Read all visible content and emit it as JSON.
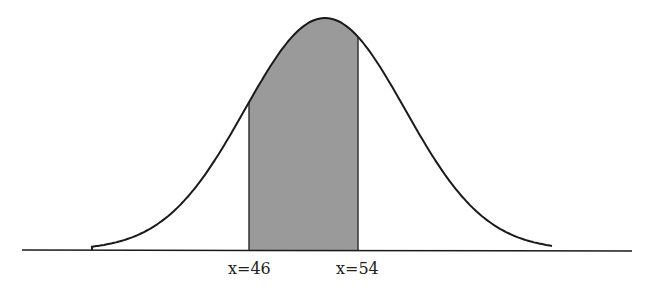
{
  "diagram": {
    "type": "normal-distribution-shaded-area",
    "curve": {
      "peak_px": [
        325,
        18
      ],
      "sigma_px": 80,
      "baseline_y_px": 250,
      "x_start_px": 22,
      "x_end_px": 632,
      "stroke_color": "#1a1a1a"
    },
    "shaded_region": {
      "left_px": 249,
      "right_px": 358,
      "fill_color": "#9a9a9a",
      "edge_color": "#333333"
    },
    "labels": [
      {
        "text": "x=46",
        "x_px": 228,
        "y_px": 259
      },
      {
        "text": "x=54",
        "x_px": 336,
        "y_px": 259
      }
    ]
  }
}
